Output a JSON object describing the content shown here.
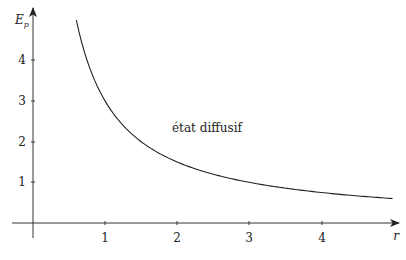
{
  "chart_data": {
    "type": "line",
    "title": "",
    "xlabel": "r",
    "ylabel": "E_p",
    "xlim": [
      -0.3,
      5.0
    ],
    "ylim": [
      -0.3,
      5.3
    ],
    "grid": false,
    "legend": null,
    "x_ticks": [
      "1",
      "2",
      "3",
      "4"
    ],
    "y_ticks": [
      "1",
      "2",
      "3",
      "4"
    ],
    "series": [
      {
        "name": "E_p(r)",
        "function": "3/r",
        "x": [
          0.6,
          0.8,
          1.0,
          1.25,
          1.5,
          2.0,
          2.5,
          3.0,
          3.5,
          4.0,
          4.5,
          4.98
        ],
        "y": [
          5.0,
          3.75,
          3.0,
          2.4,
          2.0,
          1.5,
          1.2,
          1.0,
          0.86,
          0.75,
          0.67,
          0.6
        ]
      }
    ],
    "annotations": [
      {
        "text": "état diffusif",
        "x": 1.9,
        "y": 2.3
      }
    ]
  },
  "labels": {
    "ylabel_main": "E",
    "ylabel_sub": "p",
    "xlabel": "r",
    "annotation": "état diffusif",
    "x_ticks": [
      "1",
      "2",
      "3",
      "4"
    ],
    "y_ticks": [
      "1",
      "2",
      "3",
      "4"
    ]
  }
}
